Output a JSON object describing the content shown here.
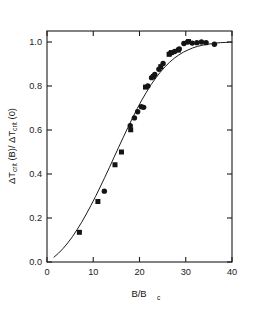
{
  "figure": {
    "background_color": "#ffffff",
    "foreground_color": "#1a1a1a"
  },
  "chart_data": {
    "type": "scatter",
    "title": "",
    "subtitle": "",
    "xlabel": "B/B_c",
    "xlabel_main": "B/B",
    "xlabel_sub": "c",
    "ylabel": "ΔT_crit (B)/ ΔT_crit (0)",
    "ylabel_part1_delta": "ΔT",
    "ylabel_part1_sub": "crit",
    "ylabel_part1_tail": " (B)/ ",
    "ylabel_part2_delta": "ΔT",
    "ylabel_part2_sub": "crit",
    "ylabel_part2_tail": " (0)",
    "xlim": [
      0,
      40
    ],
    "ylim": [
      0.0,
      1.05
    ],
    "xticks": [
      0,
      10,
      20,
      30,
      40
    ],
    "xticklabels": [
      "0",
      "10",
      "20",
      "30",
      "40"
    ],
    "yticks": [
      0.0,
      0.2,
      0.4,
      0.6,
      0.8,
      1.0
    ],
    "yticklabels": [
      "0.0",
      "0.2",
      "0.4",
      "0.6",
      "0.8",
      "1.0"
    ],
    "grid": false,
    "legend": false,
    "legend_position": "none",
    "marker_color": "#141414",
    "curve_color": "#1d1d1d",
    "series": [
      {
        "name": "squares",
        "marker": "square",
        "points": [
          [
            7.0,
            0.135
          ],
          [
            11.0,
            0.275
          ],
          [
            14.7,
            0.442
          ],
          [
            16.1,
            0.5
          ],
          [
            18.1,
            0.601
          ],
          [
            21.3,
            0.795
          ],
          [
            23.0,
            0.843
          ],
          [
            24.6,
            0.888
          ],
          [
            26.4,
            0.944
          ],
          [
            26.9,
            0.952
          ],
          [
            28.4,
            0.963
          ],
          [
            30.6,
            1.002
          ]
        ]
      },
      {
        "name": "circles",
        "marker": "circle",
        "points": [
          [
            12.4,
            0.322
          ],
          [
            18.0,
            0.62
          ],
          [
            18.9,
            0.655
          ],
          [
            19.6,
            0.683
          ],
          [
            20.4,
            0.706
          ],
          [
            20.9,
            0.703
          ],
          [
            21.8,
            0.8
          ],
          [
            22.6,
            0.838
          ],
          [
            23.3,
            0.852
          ],
          [
            24.2,
            0.876
          ],
          [
            25.1,
            0.902
          ],
          [
            26.6,
            0.948
          ],
          [
            27.6,
            0.957
          ],
          [
            28.6,
            0.968
          ],
          [
            29.6,
            0.993
          ],
          [
            30.4,
            1.0
          ],
          [
            31.4,
            0.995
          ],
          [
            32.4,
            0.997
          ],
          [
            33.4,
            1.0
          ],
          [
            34.4,
            0.997
          ],
          [
            36.2,
            0.99
          ]
        ]
      }
    ],
    "fit_curve": {
      "name": "model fit",
      "x": [
        1.5,
        2.5,
        3.5,
        4.5,
        5.5,
        6.5,
        7.5,
        8.5,
        9.5,
        10.5,
        11.5,
        12.5,
        13.5,
        14.5,
        15.5,
        16.5,
        17.5,
        18.5,
        19.5,
        20.5,
        21.5,
        22.5,
        23.5,
        24.5,
        25.5,
        26.5,
        27.5,
        28.5,
        29.5,
        30.5,
        31.5,
        32.5,
        33.5,
        34.5,
        35.5,
        36.5,
        37.5,
        38.5,
        39.5,
        40.0
      ],
      "y": [
        0.022,
        0.04,
        0.062,
        0.087,
        0.115,
        0.147,
        0.181,
        0.218,
        0.257,
        0.298,
        0.341,
        0.385,
        0.43,
        0.476,
        0.522,
        0.567,
        0.612,
        0.655,
        0.697,
        0.736,
        0.772,
        0.806,
        0.836,
        0.863,
        0.887,
        0.908,
        0.926,
        0.941,
        0.954,
        0.964,
        0.973,
        0.98,
        0.985,
        0.989,
        0.992,
        0.995,
        0.997,
        0.998,
        0.999,
        1.0
      ]
    }
  }
}
